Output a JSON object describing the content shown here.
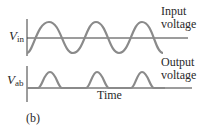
{
  "figure": {
    "panel_label": "(b)",
    "x_axis_label": "Time",
    "colors": {
      "axis": "#3a3a3a",
      "wave": "#8a8a8a",
      "text": "#2a2a2a"
    },
    "top_plot": {
      "y_label_main": "V",
      "y_label_sub": "in",
      "annotation_line1": "Input",
      "annotation_line2": "voltage",
      "waveform": "sine",
      "cycles": 3
    },
    "bottom_plot": {
      "y_label_main": "V",
      "y_label_sub": "ab",
      "annotation_line1": "Output",
      "annotation_line2": "voltage",
      "waveform": "half-wave rectified sine",
      "pulses": 3
    }
  }
}
